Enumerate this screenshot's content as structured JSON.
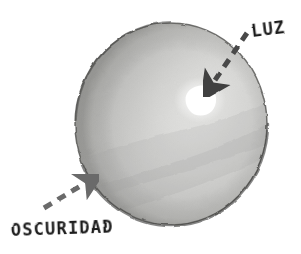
{
  "figure": {
    "background_color": "#ffffff",
    "width": 301,
    "height": 254
  },
  "sphere": {
    "name": "shaded-sphere",
    "center_x": 171,
    "center_y": 124,
    "radius_x": 97,
    "radius_y": 102,
    "outline_color": "#4a4a4a",
    "lit_color": "#f2f2f0",
    "mid_color": "#c9c9c7",
    "shadow_color": "#a2a2a0",
    "terminator_color": "#8d8d8b"
  },
  "highlight": {
    "name": "specular-highlight",
    "center_x": 200,
    "center_y": 100,
    "radius_x": 16,
    "radius_y": 13,
    "color": "#ffffff"
  },
  "annotations": [
    {
      "id": "luz",
      "label": "LUZ",
      "label_x": 252,
      "label_y": 37,
      "font_size": 17,
      "rotation": -7,
      "arrow_color": "#545454",
      "arrow_start_x": 247,
      "arrow_start_y": 33,
      "arrow_end_x": 204,
      "arrow_end_y": 96,
      "dash_pattern": "9 7",
      "stroke_width": 5
    },
    {
      "id": "oscuridad",
      "label": "OSCURIDAD",
      "label_x": 11,
      "label_y": 236,
      "font_size": 17,
      "rotation": -2,
      "arrow_color": "#6b6b6b",
      "arrow_start_x": 44,
      "arrow_start_y": 208,
      "arrow_end_x": 97,
      "arrow_end_y": 175,
      "dash_pattern": "9 7",
      "stroke_width": 5
    }
  ],
  "colors": {
    "ink": "#1b1b1b",
    "paper": "#ffffff",
    "arrow_light": "#545454",
    "arrow_dark": "#6b6b6b"
  }
}
